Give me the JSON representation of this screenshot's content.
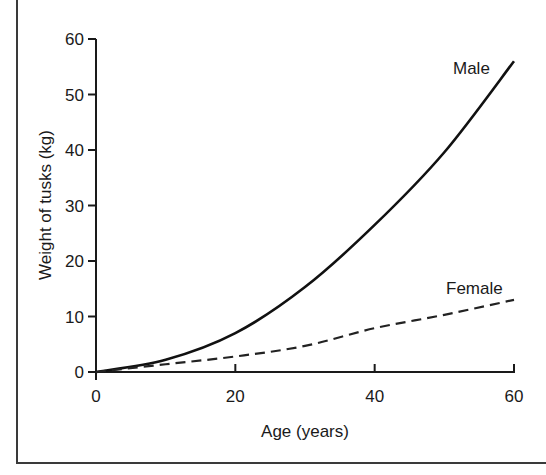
{
  "chart_data": {
    "type": "line",
    "title": "",
    "xlabel": "Age (years)",
    "ylabel": "Weight of tusks (kg)",
    "xlim": [
      0,
      60
    ],
    "ylim": [
      0,
      60
    ],
    "xticks": [
      0,
      20,
      40,
      60
    ],
    "yticks": [
      0,
      10,
      20,
      30,
      40,
      50,
      60
    ],
    "grid": false,
    "legend": "inline labels at line ends",
    "x": [
      0,
      10,
      20,
      30,
      40,
      50,
      60
    ],
    "series": [
      {
        "name": "Male",
        "style": "solid",
        "values": [
          0,
          2.2,
          7,
          15.3,
          26.5,
          39.6,
          56
        ]
      },
      {
        "name": "Female",
        "style": "dashed",
        "values": [
          0,
          1.4,
          2.8,
          4.7,
          7.9,
          10.3,
          13
        ]
      }
    ]
  },
  "labels": {
    "xlabel": "Age (years)",
    "ylabel": "Weight of tusks (kg)",
    "male": "Male",
    "female": "Female",
    "xticks": [
      "0",
      "20",
      "40",
      "60"
    ],
    "yticks": [
      "0",
      "10",
      "20",
      "30",
      "40",
      "50",
      "60"
    ]
  }
}
